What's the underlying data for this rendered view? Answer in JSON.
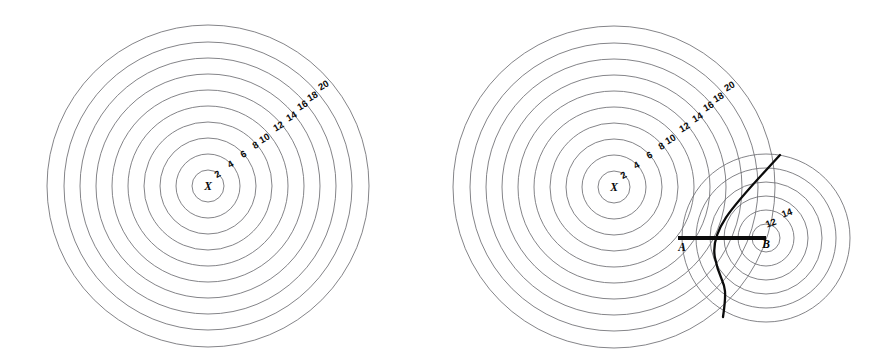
{
  "figure": {
    "background_color": "#ffffff",
    "contour_color": "#6e6e72",
    "emphasis_color": "#0b0b0b",
    "label_color": "#0a0a0a",
    "width": 881,
    "height": 363
  },
  "chart_data": {
    "type": "scatter",
    "subtitle": "",
    "xlabel": "",
    "ylabel": "",
    "grid": false,
    "legend": null,
    "panels": [
      {
        "id": "left-panel",
        "name": "unperturbed-field",
        "centers": [
          {
            "id": "X",
            "label": "X",
            "cx": 208,
            "cy": 186,
            "contour_values": [
              2,
              4,
              6,
              8,
              10,
              12,
              14,
              16,
              18,
              20
            ],
            "contour_radii": [
              16,
              32,
              48,
              64,
              80,
              96,
              112,
              128,
              144,
              161
            ]
          }
        ],
        "label_positions": [
          {
            "value": "2",
            "x": 219,
            "y": 177,
            "rotate": -30
          },
          {
            "value": "4",
            "x": 232,
            "y": 167,
            "rotate": -30
          },
          {
            "value": "6",
            "x": 245,
            "y": 157,
            "rotate": -30
          },
          {
            "value": "8",
            "x": 257,
            "y": 148,
            "rotate": -30
          },
          {
            "value": "10",
            "x": 266,
            "y": 141,
            "rotate": -30
          },
          {
            "value": "12",
            "x": 280,
            "y": 129,
            "rotate": -30
          },
          {
            "value": "14",
            "x": 293,
            "y": 119,
            "rotate": -30
          },
          {
            "value": "16",
            "x": 304,
            "y": 108,
            "rotate": -30
          },
          {
            "value": "18",
            "x": 314,
            "y": 99,
            "rotate": -30
          },
          {
            "value": "20",
            "x": 325,
            "y": 88,
            "rotate": -30
          }
        ],
        "center_label": {
          "text": "X",
          "x": 208,
          "y": 190
        }
      },
      {
        "id": "right-panel",
        "name": "perturbed-field-with-separatrix",
        "centers": [
          {
            "id": "X",
            "label": "X",
            "cx": 614,
            "cy": 187,
            "contour_values": [
              2,
              4,
              6,
              8,
              10,
              12,
              14,
              16,
              18,
              20
            ],
            "contour_radii": [
              16,
              32,
              48,
              64,
              80,
              96,
              112,
              128,
              144,
              161
            ]
          },
          {
            "id": "B",
            "label": "B",
            "cx": 766,
            "cy": 238,
            "contour_values": [
              12,
              14
            ],
            "contour_radii": [
              14,
              28,
              42,
              56,
              70,
              84
            ]
          }
        ],
        "label_positions": [
          {
            "value": "2",
            "x": 625,
            "y": 178,
            "rotate": -30
          },
          {
            "value": "4",
            "x": 638,
            "y": 168,
            "rotate": -30
          },
          {
            "value": "6",
            "x": 651,
            "y": 158,
            "rotate": -30
          },
          {
            "value": "8",
            "x": 663,
            "y": 149,
            "rotate": -30
          },
          {
            "value": "10",
            "x": 672,
            "y": 142,
            "rotate": -30
          },
          {
            "value": "12",
            "x": 686,
            "y": 130,
            "rotate": -30
          },
          {
            "value": "14",
            "x": 699,
            "y": 120,
            "rotate": -30
          },
          {
            "value": "16",
            "x": 710,
            "y": 109,
            "rotate": -30
          },
          {
            "value": "18",
            "x": 720,
            "y": 100,
            "rotate": -30
          },
          {
            "value": "20",
            "x": 731,
            "y": 89,
            "rotate": -30
          }
        ],
        "secondary_label_positions": [
          {
            "value": "12",
            "x": 772,
            "y": 226,
            "rotate": -20
          },
          {
            "value": "14",
            "x": 788,
            "y": 216,
            "rotate": -20
          }
        ],
        "center_label": {
          "text": "X",
          "x": 614,
          "y": 191
        },
        "point_labels": [
          {
            "text": "A",
            "x": 682,
            "y": 251
          },
          {
            "text": "B",
            "x": 766,
            "y": 248
          }
        ],
        "baseline": {
          "label_start": "A",
          "label_end": "B",
          "x1": 678,
          "y1": 238,
          "x2": 766,
          "y2": 238
        },
        "separatrix": {
          "description": "stagnation streamline",
          "top_x": 780,
          "top_y": 155,
          "bottom_x": 723,
          "bottom_y": 317
        }
      }
    ]
  }
}
